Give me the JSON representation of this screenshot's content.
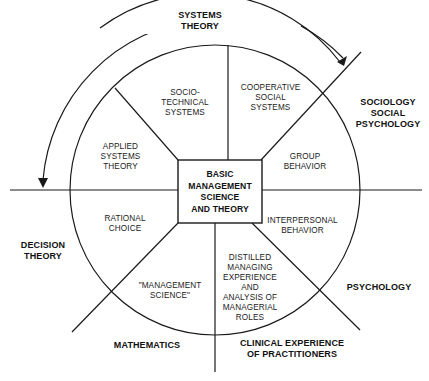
{
  "diagram": {
    "core": "BASIC\nMANAGEMENT\nSCIENCE\nAND THEORY",
    "inner_segments": [
      "SOCIO-\nTECHNICAL\nSYSTEMS",
      "COOPERATIVE\nSOCIAL\nSYSTEMS",
      "GROUP\nBEHAVIOR",
      "INTERPERSONAL\nBEHAVIOR",
      "DISTILLED\nMANAGING\nEXPERIENCE\nAND\nANALYSIS OF\nMANAGERIAL\nROLES",
      "\"MANAGEMENT\nSCIENCE\"",
      "RATIONAL\nCHOICE",
      "APPLIED\nSYSTEMS\nTHEORY"
    ],
    "outer_disciplines": [
      "SYSTEMS\nTHEORY",
      "SOCIOLOGY\nSOCIAL\nPSYCHOLOGY",
      "PSYCHOLOGY",
      "CLINICAL EXPERIENCE\nOF PRACTITIONERS",
      "MATHEMATICS",
      "DECISION\nTHEORY"
    ],
    "colors": {
      "line": "#1a1a1a",
      "background": "#ffffff"
    }
  }
}
